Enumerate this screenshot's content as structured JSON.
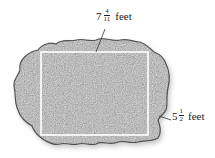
{
  "figure": {
    "colors": {
      "rock_dark": "#2b2b2b",
      "rock_mid": "#7a7a7a",
      "rock_light": "#d8d8d8",
      "rectangle_stroke": "#ffffff",
      "leader_line": "#333333",
      "text": "#222222",
      "background": "#ffffff"
    }
  },
  "labels": {
    "length": {
      "whole": "7",
      "numerator": "4",
      "denominator": "11",
      "unit": "feet"
    },
    "width": {
      "whole": "5",
      "numerator": "1",
      "denominator": "2",
      "unit": "feet"
    }
  }
}
